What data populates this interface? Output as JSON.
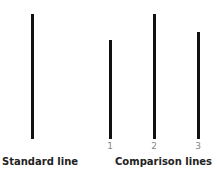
{
  "diagram": {
    "standard_label": "Standard line",
    "comparison_label": "Comparison lines",
    "line_color": "#111111",
    "lines": [
      {
        "id": "standard",
        "label": "",
        "x": 31,
        "top": 14,
        "bottom": 139
      },
      {
        "id": "1",
        "label": "1",
        "x": 109,
        "top": 40,
        "bottom": 139
      },
      {
        "id": "2",
        "label": "2",
        "x": 153,
        "top": 14,
        "bottom": 139
      },
      {
        "id": "3",
        "label": "3",
        "x": 197,
        "top": 32,
        "bottom": 139
      }
    ]
  }
}
